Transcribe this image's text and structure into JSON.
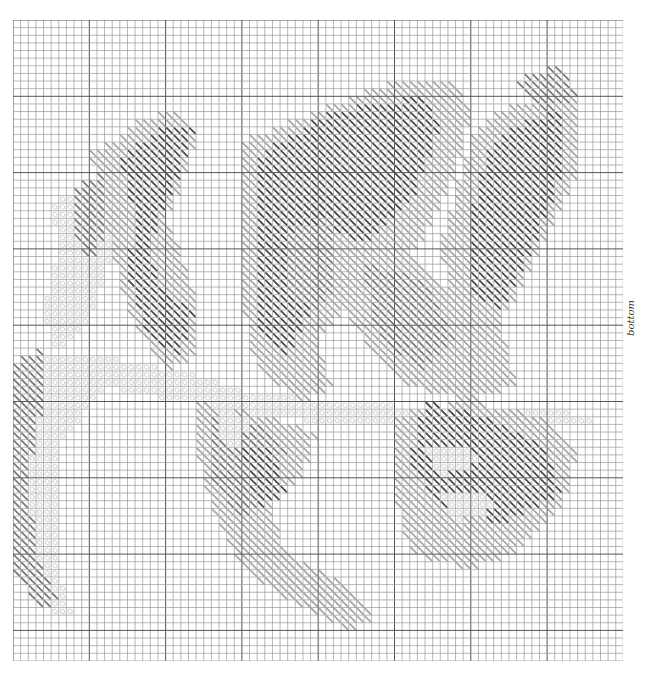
{
  "chart_title": "",
  "orientation_label": "bottom",
  "grid": {
    "cols": 80,
    "rows": 84,
    "cell_px": 7.63,
    "line_color": "#555555",
    "minor_color": "#9a9a9a"
  },
  "stitch_style": "diagonal-half-stitch",
  "shades": [
    {
      "id": "pale",
      "color": "#d6d6d6",
      "symbol": "o"
    },
    {
      "id": "light",
      "color": "#a8a8a8",
      "symbol": "\\"
    },
    {
      "id": "mid",
      "color": "#7a7a7a",
      "symbol": "\\"
    },
    {
      "id": "dark",
      "color": "#4a4a4a",
      "symbol": "\\"
    }
  ],
  "regions": [
    {
      "shade": "pale",
      "poly": [
        [
          0,
          47
        ],
        [
          4,
          44
        ],
        [
          12,
          44
        ],
        [
          22,
          46
        ],
        [
          32,
          49
        ],
        [
          44,
          50
        ],
        [
          56,
          51
        ],
        [
          70,
          51
        ],
        [
          76,
          52
        ],
        [
          76,
          53
        ],
        [
          60,
          53
        ],
        [
          44,
          53
        ],
        [
          32,
          52
        ],
        [
          22,
          50
        ],
        [
          12,
          48
        ],
        [
          6,
          56
        ],
        [
          6,
          72
        ],
        [
          8,
          78
        ],
        [
          5,
          78
        ],
        [
          1,
          70
        ],
        [
          0,
          60
        ]
      ]
    },
    {
      "shade": "pale",
      "poly": [
        [
          5,
          24
        ],
        [
          10,
          22
        ],
        [
          14,
          26
        ],
        [
          12,
          34
        ],
        [
          10,
          40
        ],
        [
          6,
          44
        ],
        [
          4,
          38
        ],
        [
          6,
          30
        ]
      ]
    },
    {
      "shade": "mid",
      "poly": [
        [
          0,
          45
        ],
        [
          4,
          43
        ],
        [
          4,
          50
        ],
        [
          2,
          60
        ],
        [
          3,
          70
        ],
        [
          6,
          76
        ],
        [
          4,
          78
        ],
        [
          0,
          72
        ]
      ]
    },
    {
      "shade": "light",
      "poly": [
        [
          10,
          17
        ],
        [
          14,
          16
        ],
        [
          16,
          13
        ],
        [
          22,
          12
        ],
        [
          24,
          16
        ],
        [
          22,
          22
        ],
        [
          20,
          26
        ],
        [
          22,
          30
        ],
        [
          24,
          36
        ],
        [
          24,
          44
        ],
        [
          20,
          46
        ],
        [
          16,
          40
        ],
        [
          14,
          34
        ],
        [
          12,
          26
        ]
      ]
    },
    {
      "shade": "dark",
      "poly": [
        [
          14,
          18
        ],
        [
          20,
          14
        ],
        [
          24,
          14
        ],
        [
          22,
          20
        ],
        [
          20,
          24
        ],
        [
          18,
          30
        ],
        [
          20,
          36
        ],
        [
          24,
          38
        ],
        [
          22,
          44
        ],
        [
          18,
          42
        ],
        [
          15,
          34
        ],
        [
          16,
          26
        ]
      ]
    },
    {
      "shade": "mid",
      "poly": [
        [
          8,
          22
        ],
        [
          12,
          20
        ],
        [
          12,
          28
        ],
        [
          10,
          32
        ],
        [
          8,
          28
        ]
      ]
    },
    {
      "shade": "light",
      "poly": [
        [
          30,
          16
        ],
        [
          40,
          12
        ],
        [
          50,
          8
        ],
        [
          58,
          8
        ],
        [
          60,
          12
        ],
        [
          58,
          20
        ],
        [
          54,
          28
        ],
        [
          50,
          34
        ],
        [
          44,
          38
        ],
        [
          40,
          42
        ],
        [
          42,
          48
        ],
        [
          38,
          50
        ],
        [
          32,
          46
        ],
        [
          30,
          36
        ],
        [
          30,
          26
        ]
      ]
    },
    {
      "shade": "dark",
      "poly": [
        [
          32,
          18
        ],
        [
          42,
          12
        ],
        [
          54,
          10
        ],
        [
          56,
          14
        ],
        [
          52,
          24
        ],
        [
          46,
          30
        ],
        [
          40,
          36
        ],
        [
          36,
          44
        ],
        [
          32,
          40
        ],
        [
          32,
          28
        ]
      ]
    },
    {
      "shade": "mid",
      "poly": [
        [
          36,
          28
        ],
        [
          42,
          26
        ],
        [
          44,
          34
        ],
        [
          40,
          38
        ],
        [
          36,
          36
        ]
      ]
    },
    {
      "shade": "light",
      "poly": [
        [
          42,
          28
        ],
        [
          52,
          30
        ],
        [
          58,
          36
        ],
        [
          64,
          40
        ],
        [
          66,
          48
        ],
        [
          60,
          50
        ],
        [
          52,
          48
        ],
        [
          46,
          42
        ],
        [
          42,
          36
        ]
      ]
    },
    {
      "shade": "mid",
      "poly": [
        [
          46,
          32
        ],
        [
          54,
          34
        ],
        [
          58,
          42
        ],
        [
          54,
          46
        ],
        [
          48,
          42
        ]
      ]
    },
    {
      "shade": "light",
      "poly": [
        [
          60,
          16
        ],
        [
          64,
          12
        ],
        [
          70,
          10
        ],
        [
          74,
          10
        ],
        [
          74,
          20
        ],
        [
          70,
          28
        ],
        [
          66,
          36
        ],
        [
          62,
          42
        ],
        [
          58,
          38
        ],
        [
          56,
          30
        ]
      ]
    },
    {
      "shade": "dark",
      "poly": [
        [
          62,
          18
        ],
        [
          66,
          14
        ],
        [
          72,
          12
        ],
        [
          72,
          20
        ],
        [
          68,
          30
        ],
        [
          64,
          38
        ],
        [
          60,
          36
        ],
        [
          60,
          26
        ]
      ]
    },
    {
      "shade": "mid",
      "poly": [
        [
          66,
          8
        ],
        [
          72,
          6
        ],
        [
          74,
          10
        ],
        [
          70,
          12
        ]
      ]
    },
    {
      "shade": "light",
      "poly": [
        [
          24,
          50
        ],
        [
          34,
          52
        ],
        [
          40,
          54
        ],
        [
          38,
          60
        ],
        [
          34,
          64
        ],
        [
          36,
          70
        ],
        [
          44,
          74
        ],
        [
          48,
          78
        ],
        [
          44,
          80
        ],
        [
          36,
          76
        ],
        [
          30,
          72
        ],
        [
          26,
          64
        ],
        [
          24,
          56
        ]
      ]
    },
    {
      "shade": "mid",
      "poly": [
        [
          26,
          52
        ],
        [
          32,
          53
        ],
        [
          36,
          56
        ],
        [
          34,
          62
        ],
        [
          30,
          66
        ],
        [
          26,
          60
        ]
      ]
    },
    {
      "shade": "pale",
      "poly": [
        [
          27,
          51
        ],
        [
          31,
          52
        ],
        [
          30,
          56
        ],
        [
          27,
          55
        ]
      ]
    },
    {
      "shade": "dark",
      "poly": [
        [
          30,
          56
        ],
        [
          34,
          56
        ],
        [
          36,
          62
        ],
        [
          32,
          64
        ]
      ]
    },
    {
      "shade": "light",
      "poly": [
        [
          50,
          52
        ],
        [
          60,
          50
        ],
        [
          70,
          52
        ],
        [
          74,
          56
        ],
        [
          72,
          64
        ],
        [
          66,
          70
        ],
        [
          60,
          72
        ],
        [
          52,
          70
        ],
        [
          50,
          62
        ]
      ]
    },
    {
      "shade": "dark",
      "poly": [
        [
          54,
          50
        ],
        [
          62,
          52
        ],
        [
          70,
          56
        ],
        [
          72,
          62
        ],
        [
          64,
          66
        ],
        [
          56,
          64
        ],
        [
          52,
          58
        ]
      ]
    },
    {
      "shade": "pale",
      "poly": [
        [
          54,
          56
        ],
        [
          60,
          56
        ],
        [
          62,
          58
        ],
        [
          56,
          60
        ]
      ]
    },
    {
      "shade": "pale",
      "poly": [
        [
          56,
          62
        ],
        [
          62,
          62
        ],
        [
          64,
          64
        ],
        [
          58,
          66
        ]
      ]
    }
  ]
}
